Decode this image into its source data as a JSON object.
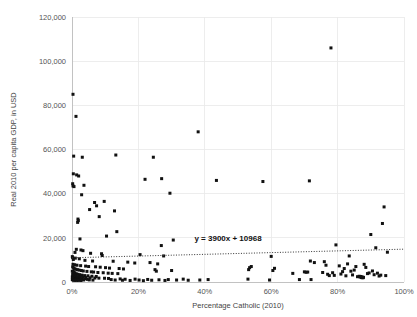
{
  "chart_data": {
    "type": "scatter",
    "title": "",
    "xlabel": "Percentage Catholic (2010)",
    "ylabel": "Real 2010 per capita GDP, in USD",
    "xlim": [
      0,
      100
    ],
    "ylim": [
      0,
      120000
    ],
    "grid": true,
    "legend": "none",
    "xticks": [
      "0%",
      "20%",
      "40%",
      "60%",
      "80%",
      "100%"
    ],
    "xtick_values": [
      0,
      20,
      40,
      60,
      80,
      100
    ],
    "yticks": [
      "0",
      "20,000",
      "40,000",
      "60,000",
      "80,000",
      "100,000",
      "120,000"
    ],
    "ytick_values": [
      0,
      20000,
      40000,
      60000,
      80000,
      100000,
      120000
    ],
    "marker_color": "#111111",
    "grid_color": "#e9e9e9",
    "trendline": {
      "label": "y = 3900x + 10968",
      "slope": 3900,
      "intercept": 10968,
      "style": "dotted",
      "x_units": "fraction",
      "label_x": 47,
      "label_y": 18500
    },
    "points": [
      [
        0.3,
        85000
      ],
      [
        1.2,
        75000
      ],
      [
        38.0,
        68000
      ],
      [
        0.5,
        57000
      ],
      [
        3.1,
        56500
      ],
      [
        13.2,
        57500
      ],
      [
        24.5,
        56500
      ],
      [
        78.0,
        106000
      ],
      [
        0.4,
        49000
      ],
      [
        1.4,
        48500
      ],
      [
        2.0,
        48000
      ],
      [
        0.2,
        44500
      ],
      [
        0.3,
        43500
      ],
      [
        0.6,
        43200
      ],
      [
        22.0,
        46500
      ],
      [
        27.0,
        46800
      ],
      [
        43.5,
        46000
      ],
      [
        57.5,
        45500
      ],
      [
        71.5,
        45800
      ],
      [
        29.5,
        40200
      ],
      [
        3.6,
        43800
      ],
      [
        2.9,
        39500
      ],
      [
        6.8,
        36000
      ],
      [
        9.7,
        36500
      ],
      [
        7.4,
        34500
      ],
      [
        12.8,
        32200
      ],
      [
        5.3,
        32800
      ],
      [
        8.2,
        29600
      ],
      [
        1.8,
        28500
      ],
      [
        1.9,
        27800
      ],
      [
        1.7,
        27000
      ],
      [
        10.4,
        20800
      ],
      [
        13.5,
        22800
      ],
      [
        2.4,
        19500
      ],
      [
        30.5,
        19000
      ],
      [
        26.9,
        16500
      ],
      [
        1.3,
        14800
      ],
      [
        2.7,
        14500
      ],
      [
        3.3,
        14200
      ],
      [
        0.9,
        13400
      ],
      [
        5.6,
        13000
      ],
      [
        8.9,
        12800
      ],
      [
        9.1,
        12000
      ],
      [
        20.5,
        12400
      ],
      [
        27.6,
        11800
      ],
      [
        0.1,
        11500
      ],
      [
        0.2,
        11000
      ],
      [
        1.0,
        10800
      ],
      [
        2.2,
        10500
      ],
      [
        0.4,
        10200
      ],
      [
        3.9,
        9800
      ],
      [
        6.2,
        9500
      ],
      [
        12.4,
        9400
      ],
      [
        16.8,
        9000
      ],
      [
        18.9,
        8600
      ],
      [
        23.5,
        8800
      ],
      [
        25.8,
        8200
      ],
      [
        0.3,
        8000
      ],
      [
        0.8,
        7800
      ],
      [
        1.5,
        7600
      ],
      [
        2.6,
        7400
      ],
      [
        4.1,
        7200
      ],
      [
        5.0,
        7000
      ],
      [
        7.1,
        6900
      ],
      [
        8.5,
        6700
      ],
      [
        10.1,
        6500
      ],
      [
        11.3,
        6300
      ],
      [
        14.2,
        6100
      ],
      [
        15.5,
        5900
      ],
      [
        0.2,
        6800
      ],
      [
        0.5,
        6400
      ],
      [
        0.7,
        6000
      ],
      [
        1.1,
        5800
      ],
      [
        1.6,
        5600
      ],
      [
        2.1,
        5400
      ],
      [
        2.8,
        5200
      ],
      [
        3.4,
        5000
      ],
      [
        4.5,
        4800
      ],
      [
        5.8,
        4600
      ],
      [
        6.5,
        4500
      ],
      [
        7.8,
        4300
      ],
      [
        9.4,
        4200
      ],
      [
        10.9,
        4000
      ],
      [
        12.1,
        3900
      ],
      [
        13.8,
        3800
      ],
      [
        0.1,
        4900
      ],
      [
        0.3,
        4700
      ],
      [
        0.6,
        4400
      ],
      [
        0.9,
        4100
      ],
      [
        1.3,
        3700
      ],
      [
        1.8,
        3500
      ],
      [
        2.3,
        3300
      ],
      [
        3.0,
        3100
      ],
      [
        3.8,
        2900
      ],
      [
        4.8,
        2800
      ],
      [
        6.0,
        2600
      ],
      [
        7.3,
        2500
      ],
      [
        0.2,
        3400
      ],
      [
        0.4,
        3200
      ],
      [
        0.8,
        3000
      ],
      [
        1.2,
        2700
      ],
      [
        1.7,
        2400
      ],
      [
        2.5,
        2200
      ],
      [
        3.2,
        2100
      ],
      [
        4.2,
        2000
      ],
      [
        5.4,
        1900
      ],
      [
        6.9,
        1800
      ],
      [
        8.1,
        1750
      ],
      [
        9.8,
        1700
      ],
      [
        0.1,
        2300
      ],
      [
        0.3,
        2050
      ],
      [
        0.5,
        1850
      ],
      [
        0.7,
        1650
      ],
      [
        1.0,
        1550
      ],
      [
        1.4,
        1450
      ],
      [
        2.0,
        1350
      ],
      [
        2.9,
        1250
      ],
      [
        0.15,
        1600
      ],
      [
        0.35,
        1400
      ],
      [
        0.55,
        1300
      ],
      [
        0.75,
        1200
      ],
      [
        1.05,
        1150
      ],
      [
        1.5,
        1050
      ],
      [
        2.4,
        980
      ],
      [
        3.5,
        930
      ],
      [
        0.1,
        1100
      ],
      [
        0.25,
        1000
      ],
      [
        0.45,
        900
      ],
      [
        0.65,
        850
      ],
      [
        0.95,
        800
      ],
      [
        1.35,
        760
      ],
      [
        1.9,
        720
      ],
      [
        2.7,
        680
      ],
      [
        4.0,
        1500
      ],
      [
        4.6,
        1200
      ],
      [
        5.2,
        950
      ],
      [
        6.3,
        880
      ],
      [
        11.0,
        1600
      ],
      [
        11.8,
        1100
      ],
      [
        13.0,
        900
      ],
      [
        14.5,
        1400
      ],
      [
        15.2,
        800
      ],
      [
        16.0,
        1250
      ],
      [
        17.5,
        700
      ],
      [
        19.0,
        1300
      ],
      [
        20.2,
        900
      ],
      [
        21.5,
        600
      ],
      [
        22.8,
        1150
      ],
      [
        24.0,
        800
      ],
      [
        25.0,
        5600
      ],
      [
        25.4,
        4900
      ],
      [
        26.2,
        1000
      ],
      [
        28.0,
        700
      ],
      [
        29.0,
        1100
      ],
      [
        30.0,
        5200
      ],
      [
        31.5,
        900
      ],
      [
        33.5,
        1300
      ],
      [
        35.0,
        800
      ],
      [
        38.5,
        900
      ],
      [
        41.0,
        1100
      ],
      [
        53.0,
        1300
      ],
      [
        53.5,
        6500
      ],
      [
        54.0,
        7000
      ],
      [
        53.2,
        5600
      ],
      [
        59.5,
        900
      ],
      [
        60.5,
        5200
      ],
      [
        60.0,
        11600
      ],
      [
        61.0,
        6200
      ],
      [
        66.5,
        3900
      ],
      [
        68.5,
        1100
      ],
      [
        70.0,
        4600
      ],
      [
        70.5,
        4400
      ],
      [
        71.0,
        4500
      ],
      [
        71.8,
        9500
      ],
      [
        72.0,
        1100
      ],
      [
        73.0,
        8800
      ],
      [
        75.5,
        4300
      ],
      [
        76.0,
        9200
      ],
      [
        76.5,
        7600
      ],
      [
        77.0,
        3500
      ],
      [
        77.5,
        2900
      ],
      [
        78.5,
        4200
      ],
      [
        79.0,
        3000
      ],
      [
        79.5,
        16800
      ],
      [
        80.5,
        7300
      ],
      [
        81.0,
        3600
      ],
      [
        81.5,
        4700
      ],
      [
        82.0,
        6100
      ],
      [
        82.5,
        2800
      ],
      [
        83.0,
        8200
      ],
      [
        83.5,
        11800
      ],
      [
        84.0,
        4900
      ],
      [
        84.5,
        3200
      ],
      [
        85.0,
        5400
      ],
      [
        85.5,
        7000
      ],
      [
        86.0,
        2400
      ],
      [
        86.5,
        2600
      ],
      [
        86.8,
        2200
      ],
      [
        87.0,
        2500
      ],
      [
        87.2,
        2000
      ],
      [
        87.4,
        2300
      ],
      [
        87.6,
        1900
      ],
      [
        87.8,
        2100
      ],
      [
        88.0,
        8000
      ],
      [
        88.5,
        6600
      ],
      [
        89.0,
        3800
      ],
      [
        89.5,
        4100
      ],
      [
        90.0,
        21500
      ],
      [
        90.5,
        5000
      ],
      [
        91.0,
        3300
      ],
      [
        91.5,
        15500
      ],
      [
        92.0,
        4000
      ],
      [
        92.5,
        2700
      ],
      [
        93.0,
        3100
      ],
      [
        93.5,
        26500
      ],
      [
        94.0,
        34000
      ],
      [
        94.5,
        2900
      ],
      [
        95.0,
        13500
      ]
    ]
  }
}
